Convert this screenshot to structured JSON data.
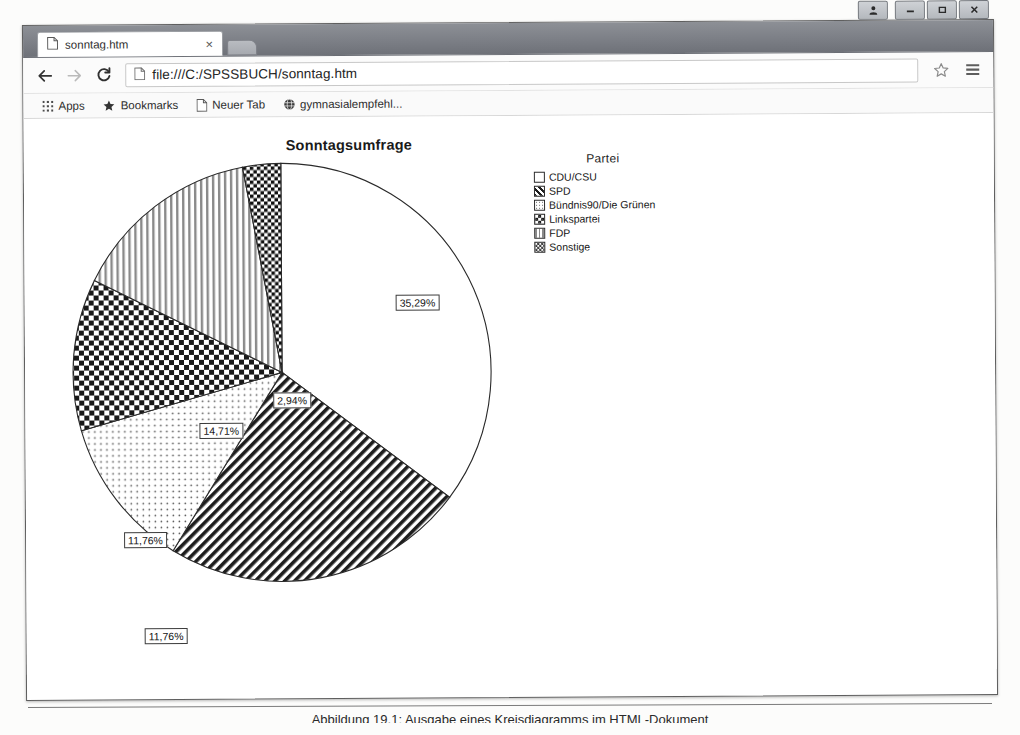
{
  "window": {
    "controls": [
      {
        "name": "person-icon",
        "label": " "
      },
      {
        "name": "minimize",
        "label": "—"
      },
      {
        "name": "maximize",
        "label": "□"
      },
      {
        "name": "close",
        "label": "x"
      }
    ]
  },
  "tab": {
    "title": "sonntag.htm",
    "close_label": "×",
    "favicon": "page-icon"
  },
  "toolbar": {
    "back_label": "←",
    "forward_label": "→",
    "reload_label": "C",
    "url": "file:///C:/SPSSBUCH/sonntag.htm",
    "page_icon": "page-icon",
    "star_icon": "star-icon",
    "menu_icon": "hamburger-menu-icon"
  },
  "bookmarks": [
    {
      "label": "Apps",
      "icon": "apps-grid-icon"
    },
    {
      "label": "Bookmarks",
      "icon": "star-icon"
    },
    {
      "label": "Neuer Tab",
      "icon": "page-icon"
    },
    {
      "label": "gymnasialempfehl...",
      "icon": "globe-icon"
    }
  ],
  "caption": {
    "text": "Abbildung 19.1: Ausgabe eines Kreisdiagramms im HTML-Dokument"
  },
  "chart_data": {
    "type": "pie",
    "title": "Sonntagsumfrage",
    "legend_title": "Partei",
    "legend_position": "right",
    "start_angle_deg": 0,
    "direction": "clockwise",
    "categories": [
      "CDU/CSU",
      "SPD",
      "Bündnis90/Die Grünen",
      "Linkspartei",
      "FDP",
      "Sonstige"
    ],
    "values": [
      35.29,
      23.53,
      11.76,
      11.76,
      14.71,
      2.94
    ],
    "labels": [
      "35,29%",
      "23,53%",
      "11,76%",
      "11,76%",
      "14,71%",
      "2,94%"
    ],
    "patterns": [
      "solid-white",
      "diagonal-stripes",
      "fine-dots",
      "coarse-checker",
      "vertical-stripes",
      "dense-checker"
    ],
    "xlabel": "",
    "ylabel": "",
    "grid": false
  }
}
